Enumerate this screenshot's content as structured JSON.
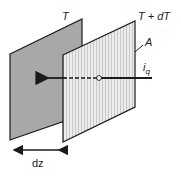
{
  "labels": {
    "t_left": "T",
    "t_right": "T + dT",
    "area": "A",
    "flux_i": "i",
    "flux_sub": "q",
    "thickness": "dz"
  },
  "colors": {
    "left_plane": "#a9a9a9",
    "right_plane": "#e2e2e2",
    "stroke": "#1a1a1a"
  }
}
